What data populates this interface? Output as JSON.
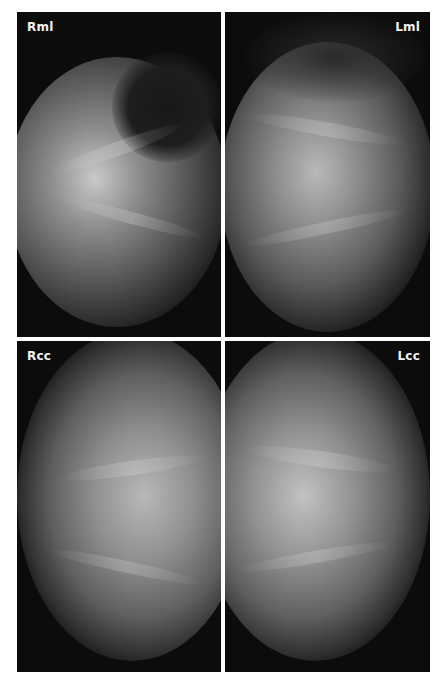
{
  "figure": {
    "type": "mammogram-four-view",
    "background_color": "#ffffff",
    "panel_color": "#0c0c0c",
    "label_color": "#f2f2f2"
  },
  "panels": [
    {
      "position": "top-left",
      "label": "Rml"
    },
    {
      "position": "top-right",
      "label": "Lml"
    },
    {
      "position": "bottom-left",
      "label": "Rcc"
    },
    {
      "position": "bottom-right",
      "label": "Lcc"
    }
  ]
}
